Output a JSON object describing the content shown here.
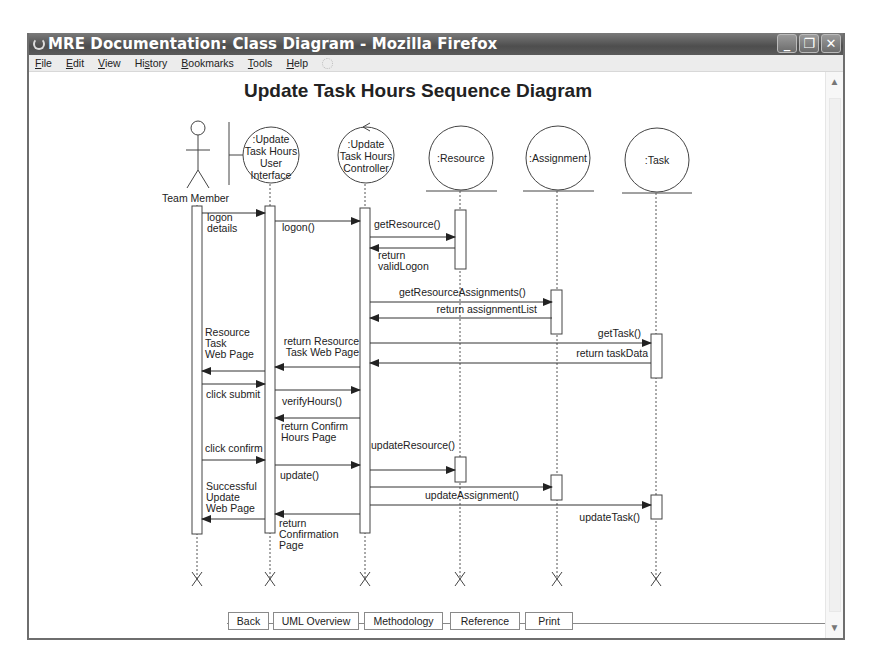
{
  "window": {
    "title": "MRE Documentation: Class Diagram - Mozilla Firefox",
    "controls": {
      "minimize": "_",
      "restore": "❐",
      "close": "✕"
    }
  },
  "menubar": {
    "items": [
      {
        "label": "File",
        "accel": "F"
      },
      {
        "label": "Edit",
        "accel": "E"
      },
      {
        "label": "View",
        "accel": "V"
      },
      {
        "label": "History",
        "accel": "s"
      },
      {
        "label": "Bookmarks",
        "accel": "B"
      },
      {
        "label": "Tools",
        "accel": "T"
      },
      {
        "label": "Help",
        "accel": "H"
      }
    ]
  },
  "page": {
    "title": "Update Task Hours Sequence Diagram"
  },
  "diagram": {
    "actor": {
      "label": "Team Member"
    },
    "lifelines": [
      {
        "id": "actor",
        "x": 195,
        "type": "actor",
        "lines": [
          "Team Member"
        ]
      },
      {
        "id": "ui",
        "x": 268,
        "type": "boundary",
        "lines": [
          ":Update",
          "Task Hours",
          "User",
          "Interface"
        ]
      },
      {
        "id": "ctrl",
        "x": 363,
        "type": "control",
        "lines": [
          ":Update",
          "Task Hours",
          "Controller"
        ]
      },
      {
        "id": "res",
        "x": 458,
        "type": "entity",
        "lines": [
          ":Resource"
        ]
      },
      {
        "id": "asg",
        "x": 555,
        "type": "entity",
        "lines": [
          ":Assignment"
        ]
      },
      {
        "id": "task",
        "x": 654,
        "type": "entity",
        "lines": [
          ":Task"
        ]
      }
    ],
    "messages": [
      {
        "from": 200,
        "to": 263,
        "y": 213,
        "label": [
          "logon",
          "details"
        ],
        "lx": 205,
        "ly": 221,
        "anchor": "start"
      },
      {
        "from": 273,
        "to": 358,
        "y": 221,
        "label": [
          "logon()"
        ],
        "lx": 280,
        "ly": 231,
        "anchor": "start"
      },
      {
        "from": 368,
        "to": 453,
        "y": 237,
        "label": [
          "getResource()"
        ],
        "lx": 372,
        "ly": 228,
        "anchor": "start"
      },
      {
        "from": 453,
        "to": 368,
        "y": 248,
        "label": [
          "return",
          "validLogon"
        ],
        "lx": 376,
        "ly": 259,
        "anchor": "start"
      },
      {
        "from": 368,
        "to": 550,
        "y": 302,
        "label": [
          "getResourceAssignments()"
        ],
        "lx": 397,
        "ly": 296,
        "anchor": "start"
      },
      {
        "from": 550,
        "to": 368,
        "y": 318,
        "label": [
          "return assignmentList"
        ],
        "lx": 535,
        "ly": 313,
        "anchor": "end"
      },
      {
        "from": 368,
        "to": 649,
        "y": 343,
        "label": [
          "getTask()"
        ],
        "lx": 639,
        "ly": 337,
        "anchor": "end"
      },
      {
        "from": 649,
        "to": 368,
        "y": 363,
        "label": [
          "return taskData"
        ],
        "lx": 646,
        "ly": 357,
        "anchor": "end"
      },
      {
        "from": 358,
        "to": 273,
        "y": 367,
        "label": [
          "return Resource",
          "Task Web Page"
        ],
        "lx": 357,
        "ly": 345,
        "anchor": "end"
      },
      {
        "from": 263,
        "to": 200,
        "y": 371,
        "label": [
          "Resource",
          "Task",
          "Web Page"
        ],
        "lx": 203,
        "ly": 336,
        "anchor": "start"
      },
      {
        "from": 200,
        "to": 263,
        "y": 384,
        "label": [
          "click submit"
        ],
        "lx": 204,
        "ly": 398,
        "anchor": "start"
      },
      {
        "from": 273,
        "to": 358,
        "y": 390,
        "label": [
          "verifyHours()"
        ],
        "lx": 280,
        "ly": 405,
        "anchor": "start"
      },
      {
        "from": 358,
        "to": 273,
        "y": 418,
        "label": [
          "return Confirm",
          "Hours Page"
        ],
        "lx": 279,
        "ly": 430,
        "anchor": "start"
      },
      {
        "from": 200,
        "to": 263,
        "y": 460,
        "label": [
          "click confirm"
        ],
        "lx": 203,
        "ly": 452,
        "anchor": "start"
      },
      {
        "from": 273,
        "to": 358,
        "y": 465,
        "label": [
          "update()"
        ],
        "lx": 278,
        "ly": 479,
        "anchor": "start"
      },
      {
        "from": 368,
        "to": 453,
        "y": 470,
        "label": [
          "updateResource()"
        ],
        "lx": 369,
        "ly": 449,
        "anchor": "start"
      },
      {
        "from": 368,
        "to": 550,
        "y": 487,
        "label": [
          "updateAssignment()"
        ],
        "lx": 423,
        "ly": 499,
        "anchor": "start"
      },
      {
        "from": 368,
        "to": 649,
        "y": 505,
        "label": [
          "updateTask()"
        ],
        "lx": 638,
        "ly": 521,
        "anchor": "end"
      },
      {
        "from": 358,
        "to": 273,
        "y": 514,
        "label": [
          "return",
          "Confirmation",
          "Page"
        ],
        "lx": 277,
        "ly": 527,
        "anchor": "start"
      },
      {
        "from": 263,
        "to": 200,
        "y": 519,
        "label": [
          "Successful",
          "Update",
          "Web Page"
        ],
        "lx": 204,
        "ly": 490,
        "anchor": "start"
      }
    ],
    "activations": [
      {
        "x": 190,
        "y": 206,
        "w": 10,
        "h": 328
      },
      {
        "x": 263,
        "y": 206,
        "w": 10,
        "h": 327
      },
      {
        "x": 358,
        "y": 208,
        "w": 10,
        "h": 325
      },
      {
        "x": 453,
        "y": 210,
        "w": 11,
        "h": 59
      },
      {
        "x": 549,
        "y": 290,
        "w": 11,
        "h": 44
      },
      {
        "x": 649,
        "y": 334,
        "w": 11,
        "h": 44
      },
      {
        "x": 453,
        "y": 457,
        "w": 11,
        "h": 25
      },
      {
        "x": 549,
        "y": 475,
        "w": 11,
        "h": 25
      },
      {
        "x": 649,
        "y": 495,
        "w": 11,
        "h": 24
      }
    ],
    "terminators_y": 579
  },
  "navbar": {
    "buttons": [
      {
        "label": "Back",
        "x": 226,
        "w": 41
      },
      {
        "label": "UML Overview",
        "x": 271,
        "w": 86
      },
      {
        "label": "Methodology",
        "x": 362,
        "w": 79
      },
      {
        "label": "Reference",
        "x": 448,
        "w": 70
      },
      {
        "label": "Print",
        "x": 523,
        "w": 48
      }
    ]
  }
}
